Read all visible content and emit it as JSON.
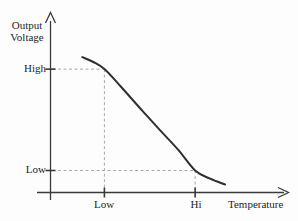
{
  "figure": {
    "background": "#fdfdfd"
  },
  "chart_data": {
    "type": "line",
    "title": "",
    "xlabel": "Temperature",
    "ylabel": "Output Voltage",
    "x_tick_labels": [
      "Low",
      "Hi"
    ],
    "y_tick_labels": [
      "High",
      "Low"
    ],
    "grid": false,
    "legend": null,
    "axis_style": "arrows",
    "x_range_normalized": [
      0,
      1
    ],
    "y_range_normalized": [
      0,
      1
    ],
    "series": [
      {
        "name": "output-voltage-curve",
        "shape": "decreasing-sigmoid",
        "points_normalized": [
          [
            0.134,
            0.763
          ],
          [
            0.18,
            0.735
          ],
          [
            0.227,
            0.695
          ],
          [
            0.294,
            0.6
          ],
          [
            0.387,
            0.46
          ],
          [
            0.462,
            0.35
          ],
          [
            0.538,
            0.24
          ],
          [
            0.609,
            0.124
          ],
          [
            0.672,
            0.078
          ],
          [
            0.735,
            0.045
          ]
        ]
      }
    ],
    "reference_lines": [
      {
        "x": 0.227,
        "y": 0.695,
        "x_tick": "Low",
        "y_tick": "High"
      },
      {
        "x": 0.609,
        "y": 0.124,
        "x_tick": "Hi",
        "y_tick": "Low"
      }
    ],
    "colors": {
      "curve": "#2f2f2f",
      "axis": "#3a3a3a",
      "dashed": "#a9a9a9",
      "text": "#1f1f1f"
    }
  }
}
